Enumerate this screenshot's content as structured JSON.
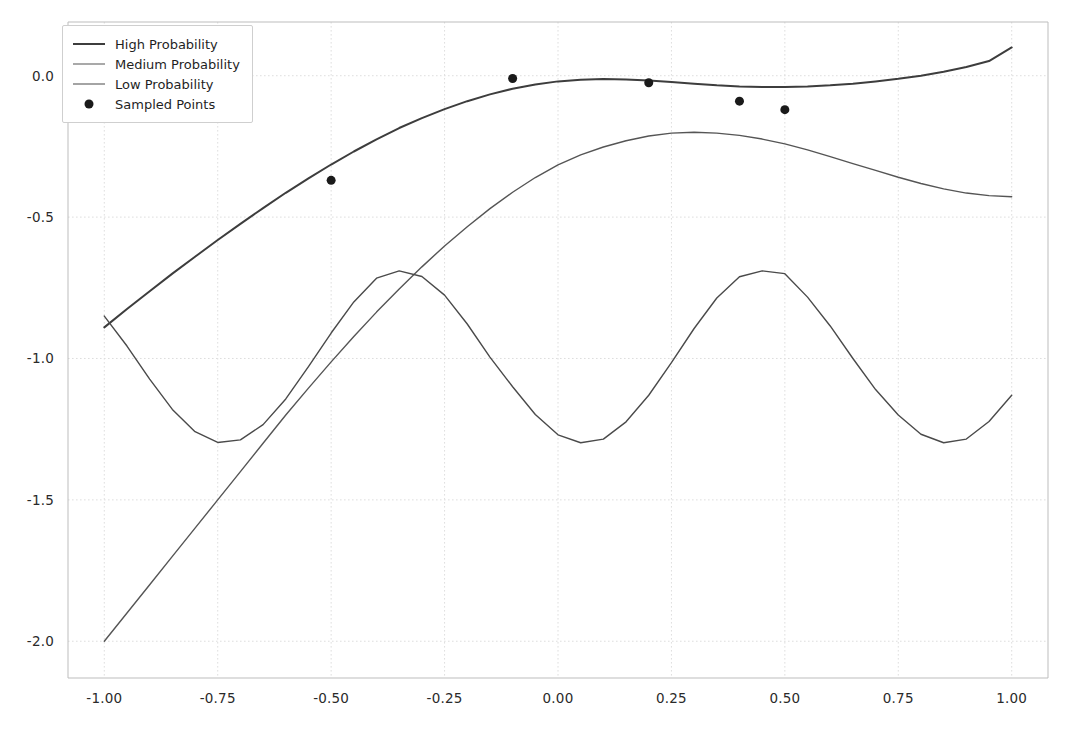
{
  "chart_data": {
    "type": "line",
    "title": "",
    "xlabel": "",
    "ylabel": "",
    "xlim": [
      -1.08,
      1.08
    ],
    "ylim": [
      -2.13,
      0.19
    ],
    "grid": true,
    "legend_position": "upper left",
    "xticks": [
      "-1.00",
      "-0.75",
      "-0.50",
      "-0.25",
      "0.00",
      "0.25",
      "0.50",
      "0.75",
      "1.00"
    ],
    "xtick_values": [
      -1.0,
      -0.75,
      -0.5,
      -0.25,
      0.0,
      0.25,
      0.5,
      0.75,
      1.0
    ],
    "yticks": [
      "0.0",
      "-0.5",
      "-1.0",
      "-1.5",
      "-2.0"
    ],
    "ytick_values": [
      0.0,
      -0.5,
      -1.0,
      -1.5,
      -2.0
    ],
    "series": [
      {
        "name": "High Probability",
        "type": "line",
        "color": "#3d3d3d",
        "linewidth": 2.0,
        "x": [
          -1.0,
          -0.95,
          -0.9,
          -0.85,
          -0.8,
          -0.75,
          -0.7,
          -0.65,
          -0.6,
          -0.55,
          -0.5,
          -0.45,
          -0.4,
          -0.35,
          -0.3,
          -0.25,
          -0.2,
          -0.15,
          -0.1,
          -0.05,
          0.0,
          0.05,
          0.1,
          0.15,
          0.2,
          0.25,
          0.3,
          0.35,
          0.4,
          0.45,
          0.5,
          0.55,
          0.6,
          0.65,
          0.7,
          0.75,
          0.8,
          0.85,
          0.9,
          0.95,
          1.0
        ],
        "y": [
          -0.89,
          -0.825,
          -0.762,
          -0.7,
          -0.64,
          -0.581,
          -0.524,
          -0.468,
          -0.414,
          -0.363,
          -0.314,
          -0.268,
          -0.225,
          -0.185,
          -0.15,
          -0.118,
          -0.09,
          -0.066,
          -0.046,
          -0.031,
          -0.02,
          -0.014,
          -0.012,
          -0.013,
          -0.017,
          -0.022,
          -0.028,
          -0.034,
          -0.038,
          -0.04,
          -0.04,
          -0.038,
          -0.034,
          -0.028,
          -0.02,
          -0.011,
          0.0,
          0.014,
          0.031,
          0.052,
          0.1
        ]
      },
      {
        "name": "Medium Probability",
        "type": "line",
        "color": "#555555",
        "linewidth": 1.4,
        "x": [
          -1.0,
          -0.95,
          -0.9,
          -0.85,
          -0.8,
          -0.75,
          -0.7,
          -0.65,
          -0.6,
          -0.55,
          -0.5,
          -0.45,
          -0.4,
          -0.35,
          -0.3,
          -0.25,
          -0.2,
          -0.15,
          -0.1,
          -0.05,
          0.0,
          0.05,
          0.1,
          0.15,
          0.2,
          0.25,
          0.3,
          0.35,
          0.4,
          0.45,
          0.5,
          0.55,
          0.6,
          0.65,
          0.7,
          0.75,
          0.8,
          0.85,
          0.9,
          0.95,
          1.0
        ],
        "y": [
          -2.0,
          -1.9,
          -1.8,
          -1.7,
          -1.6,
          -1.5,
          -1.4,
          -1.3,
          -1.2,
          -1.105,
          -1.012,
          -0.922,
          -0.836,
          -0.754,
          -0.676,
          -0.602,
          -0.534,
          -0.47,
          -0.412,
          -0.36,
          -0.315,
          -0.28,
          -0.252,
          -0.23,
          -0.213,
          -0.203,
          -0.2,
          -0.203,
          -0.211,
          -0.224,
          -0.241,
          -0.262,
          -0.286,
          -0.311,
          -0.335,
          -0.359,
          -0.381,
          -0.4,
          -0.415,
          -0.424,
          -0.428
        ]
      },
      {
        "name": "Low Probability",
        "type": "line",
        "color": "#4a4a4a",
        "linewidth": 1.4,
        "x": [
          -1.0,
          -0.95,
          -0.9,
          -0.85,
          -0.8,
          -0.75,
          -0.7,
          -0.65,
          -0.6,
          -0.55,
          -0.5,
          -0.45,
          -0.4,
          -0.35,
          -0.3,
          -0.25,
          -0.2,
          -0.15,
          -0.1,
          -0.05,
          0.0,
          0.05,
          0.1,
          0.15,
          0.2,
          0.25,
          0.3,
          0.35,
          0.4,
          0.45,
          0.5,
          0.55,
          0.6,
          0.65,
          0.7,
          0.75,
          0.8,
          0.85,
          0.9,
          0.95,
          1.0
        ],
        "y": [
          -0.85,
          -0.956,
          -1.073,
          -1.18,
          -1.259,
          -1.297,
          -1.288,
          -1.234,
          -1.143,
          -1.029,
          -0.91,
          -0.8,
          -0.716,
          -0.69,
          -0.71,
          -0.776,
          -0.878,
          -0.995,
          -1.1,
          -1.198,
          -1.27,
          -1.298,
          -1.285,
          -1.224,
          -1.13,
          -1.015,
          -0.894,
          -0.786,
          -0.711,
          -0.69,
          -0.7,
          -0.783,
          -0.885,
          -1.0,
          -1.11,
          -1.2,
          -1.268,
          -1.298,
          -1.285,
          -1.223,
          -1.13
        ]
      }
    ],
    "scatter": {
      "name": "Sampled Points",
      "color": "#1a1a1a",
      "marker": "o",
      "size": 9,
      "points": [
        {
          "x": -0.5,
          "y": -0.37
        },
        {
          "x": -0.1,
          "y": -0.01
        },
        {
          "x": 0.2,
          "y": -0.025
        },
        {
          "x": 0.4,
          "y": -0.09
        },
        {
          "x": 0.5,
          "y": -0.12
        }
      ]
    }
  },
  "legend": {
    "items": [
      {
        "label": "High Probability",
        "kind": "line",
        "color": "#3d3d3d",
        "width": 2.6
      },
      {
        "label": "Medium Probability",
        "kind": "line",
        "color": "#555555",
        "width": 1.3
      },
      {
        "label": "Low Probability",
        "kind": "line",
        "color": "#4a4a4a",
        "width": 1.3
      },
      {
        "label": "Sampled Points",
        "kind": "marker",
        "color": "#1a1a1a",
        "width": 0
      }
    ]
  },
  "axes": {
    "spine_color": "#bdbdbd",
    "grid_color": "#dedede",
    "tick_label_color": "#2a2a2a",
    "background": "#ffffff"
  }
}
